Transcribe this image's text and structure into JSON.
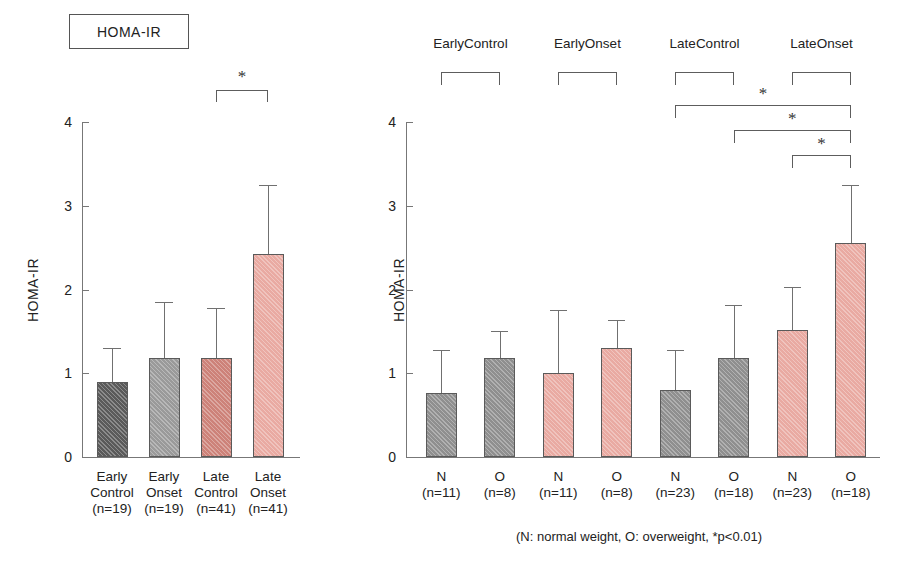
{
  "figure": {
    "title_box_label": "HOMA-IR",
    "footnote": "(N: normal weight, O: overweight, *p<0.01)",
    "significance_marker": "*"
  },
  "colors": {
    "bar_dark_gray": "#5a5a5a",
    "bar_mid_gray": "#9a9a9a",
    "bar_gray": "#8f8f8f",
    "bar_salmon": "#cd8279",
    "bar_pink": "#e9aaa2",
    "axis": "#777777",
    "bracket": "#5d5d5d",
    "text": "#222222"
  },
  "chart_data": [
    {
      "type": "bar",
      "id": "panel-left",
      "title": "HOMA-IR",
      "xlabel": "",
      "ylabel": "HOMA-IR",
      "ylim": [
        0,
        4
      ],
      "yticks": [
        0,
        1,
        2,
        3,
        4
      ],
      "ytick_labels": [
        "0",
        "1",
        "2",
        "3",
        "4"
      ],
      "grid": false,
      "legend": "none",
      "categories": [
        "Early Control",
        "Early Onset",
        "Late Control",
        "Late Onset"
      ],
      "category_lines": [
        [
          "Early",
          "Control",
          "(n=19)"
        ],
        [
          "Early",
          "Onset",
          "(n=19)"
        ],
        [
          "Late",
          "Control",
          "(n=41)"
        ],
        [
          "Late",
          "Onset",
          "(n=41)"
        ]
      ],
      "n": [
        19,
        19,
        41,
        41
      ],
      "values": [
        0.9,
        1.18,
        1.18,
        2.42
      ],
      "error_upper": [
        1.3,
        1.85,
        1.78,
        3.25
      ],
      "bar_colors": [
        "#5a5a5a",
        "#9a9a9a",
        "#cd8279",
        "#e9aaa2"
      ],
      "annotations": [
        {
          "type": "significance-bracket",
          "from": "Late Control",
          "to": "Late Onset",
          "label": "*",
          "y": 3.9
        }
      ]
    },
    {
      "type": "bar",
      "id": "panel-right",
      "title": "",
      "xlabel": "",
      "ylabel": "HOMA-IR",
      "ylim": [
        0,
        4
      ],
      "yticks": [
        0,
        1,
        2,
        3,
        4
      ],
      "ytick_labels": [
        "0",
        "1",
        "2",
        "3",
        "4"
      ],
      "grid": false,
      "legend": "none",
      "categories": [
        "N",
        "O",
        "N",
        "O",
        "N",
        "O",
        "N",
        "O"
      ],
      "category_sub": [
        "(n=11)",
        "(n=8)",
        "(n=11)",
        "(n=8)",
        "(n=23)",
        "(n=18)",
        "(n=23)",
        "(n=18)"
      ],
      "n": [
        11,
        8,
        11,
        8,
        23,
        18,
        23,
        18
      ],
      "values": [
        0.77,
        1.18,
        1.0,
        1.3,
        0.8,
        1.18,
        1.52,
        2.55
      ],
      "error_upper": [
        1.28,
        1.5,
        1.75,
        1.63,
        1.28,
        1.82,
        2.03,
        3.25
      ],
      "bar_colors": [
        "#8f8f8f",
        "#8f8f8f",
        "#e9aaa2",
        "#e9aaa2",
        "#8f8f8f",
        "#8f8f8f",
        "#e9aaa2",
        "#e9aaa2"
      ],
      "groups": [
        {
          "label_lines": [
            "Early",
            "Control"
          ],
          "members": [
            0,
            1
          ]
        },
        {
          "label_lines": [
            "Early",
            "Onset"
          ],
          "members": [
            2,
            3
          ]
        },
        {
          "label_lines": [
            "Late",
            "Control"
          ],
          "members": [
            4,
            5
          ]
        },
        {
          "label_lines": [
            "Late",
            "Onset"
          ],
          "members": [
            6,
            7
          ]
        }
      ],
      "annotations": [
        {
          "type": "significance-bracket",
          "from_index": 4,
          "to_index": 7,
          "label": "*"
        },
        {
          "type": "significance-bracket",
          "from_index": 5,
          "to_index": 7,
          "label": "*"
        },
        {
          "type": "significance-bracket",
          "from_index": 6,
          "to_index": 7,
          "label": "*"
        }
      ]
    }
  ]
}
